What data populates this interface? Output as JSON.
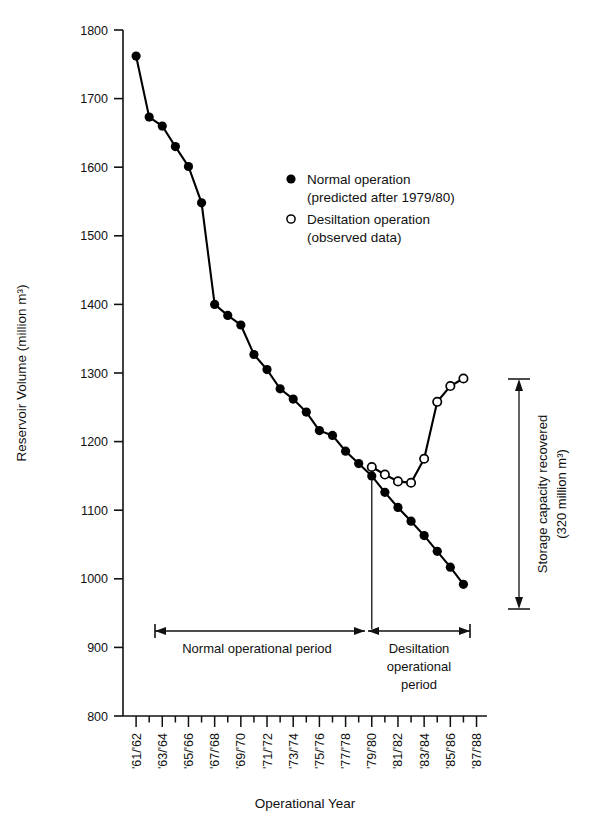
{
  "chart_data": {
    "type": "line",
    "title": "",
    "xlabel": "Operational Year",
    "ylabel": "Reservoir Volume (million m³)",
    "ylim": [
      800,
      1800
    ],
    "ytick_labels": [
      "800",
      "900",
      "1000",
      "1100",
      "1200",
      "1300",
      "1400",
      "1500",
      "1600",
      "1700",
      "1800"
    ],
    "ytick_values": [
      800,
      900,
      1000,
      1100,
      1200,
      1300,
      1400,
      1500,
      1600,
      1700,
      1800
    ],
    "grid": false,
    "legend_position": "upper-center",
    "categories": [
      "'61/62",
      "'62/63",
      "'63/64",
      "'64/65",
      "'65/66",
      "'66/67",
      "'67/68",
      "'68/69",
      "'69/70",
      "'70/71",
      "'71/72",
      "'72/73",
      "'73/74",
      "'74/75",
      "'75/76",
      "'76/77",
      "'77/78",
      "'78/79",
      "'79/80",
      "'80/81",
      "'81/82",
      "'82/83",
      "'83/84",
      "'84/85",
      "'85/86",
      "'86/87",
      "'87/88"
    ],
    "xtick_labels": [
      "'61/'62",
      "'63/'64",
      "'65/'66",
      "'67/'68",
      "'69/'70",
      "'71/'72",
      "'73/'74",
      "'75/'76",
      "'77/'78",
      "'79/'80",
      "'81/'82",
      "'83/'84",
      "'85/'86",
      "'87/'88"
    ],
    "xtick_label_indices": [
      0,
      2,
      4,
      6,
      8,
      10,
      12,
      14,
      16,
      18,
      20,
      22,
      24,
      26
    ],
    "series": [
      {
        "name": "Normal operation (predicted after 1979/80)",
        "marker": "filled-circle",
        "color": "#000000",
        "x": [
          "'61/62",
          "'62/63",
          "'63/64",
          "'64/65",
          "'65/66",
          "'66/67",
          "'67/68",
          "'68/69",
          "'69/70",
          "'70/71",
          "'71/72",
          "'72/73",
          "'73/74",
          "'74/75",
          "'75/76",
          "'76/77",
          "'77/78",
          "'78/79",
          "'79/80",
          "'80/81",
          "'81/82",
          "'82/83",
          "'83/84",
          "'84/85",
          "'85/86",
          "'86/87"
        ],
        "values": [
          1762,
          1673,
          1660,
          1630,
          1601,
          1548,
          1400,
          1384,
          1370,
          1327,
          1305,
          1277,
          1262,
          1243,
          1216,
          1209,
          1186,
          1168,
          1150,
          1126,
          1104,
          1084,
          1063,
          1040,
          1017,
          992
        ]
      },
      {
        "name": "Desiltation operation (observed data)",
        "marker": "open-circle",
        "color": "#000000",
        "x": [
          "'79/80",
          "'80/81",
          "'81/82",
          "'82/83",
          "'83/84",
          "'84/85",
          "'85/86",
          "'86/87"
        ],
        "values": [
          1163,
          1152,
          1142,
          1140,
          1175,
          1258,
          1281,
          1292
        ]
      }
    ],
    "annotations": [
      {
        "name": "storage-capacity-recovered",
        "text_line1": "Storage capacity recovered",
        "text_line2": "(320 million m³)",
        "from_value": 1292,
        "to_value": 965,
        "amount": "320 million m³"
      },
      {
        "name": "normal-operational-period",
        "text": "Normal operational period"
      },
      {
        "name": "desiltation-operational-period",
        "text_lines": [
          "Desiltation",
          "operational",
          "period"
        ]
      }
    ],
    "divider": {
      "at": "'79/80",
      "label": "1979/80 transition"
    }
  },
  "legend": {
    "entries": [
      {
        "marker": "filled-circle",
        "line1": "Normal operation",
        "line2": "(predicted after 1979/80)"
      },
      {
        "marker": "open-circle",
        "line1": "Desiltation operation",
        "line2": "(observed data)"
      }
    ]
  },
  "axes": {
    "y_title": "Reservoir Volume (million m³)",
    "x_title": "Operational Year"
  },
  "endpoints": {
    "solid_last_value": 965,
    "open_last_value": 1292
  },
  "colors": {
    "ink": "#000000",
    "paper": "#ffffff"
  }
}
